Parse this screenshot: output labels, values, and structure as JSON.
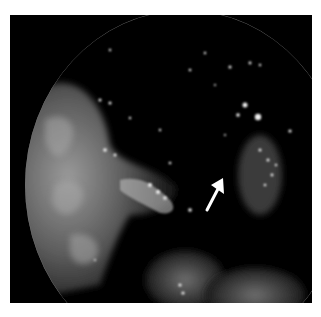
{
  "image": {
    "description": "Grayscale endoscopic image within circular field of view on black background",
    "annotation": {
      "type": "arrow",
      "color": "#ffffff",
      "direction": "up-right",
      "label": ""
    },
    "colors": {
      "background": "#000000",
      "page": "#ffffff",
      "tissue": "#8a8a8a",
      "highlight": "#f2f2f2"
    }
  }
}
